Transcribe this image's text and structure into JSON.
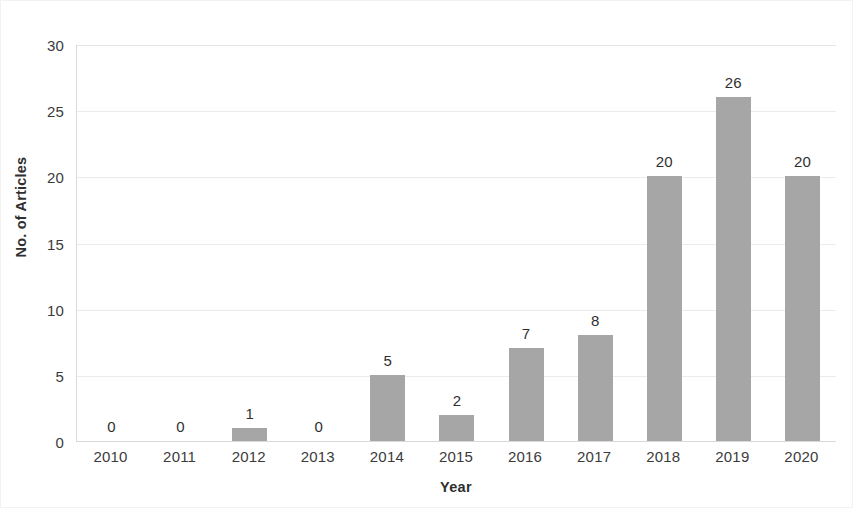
{
  "chart_data": {
    "type": "bar",
    "title": "",
    "xlabel": "Year",
    "ylabel": "No. of Articles",
    "categories": [
      "2010",
      "2011",
      "2012",
      "2013",
      "2014",
      "2015",
      "2016",
      "2017",
      "2018",
      "2019",
      "2020"
    ],
    "values": [
      0,
      0,
      1,
      0,
      5,
      2,
      7,
      8,
      20,
      26,
      20
    ],
    "data_labels": [
      "0",
      "0",
      "1",
      "0",
      "5",
      "2",
      "7",
      "8",
      "20",
      "26",
      "20"
    ],
    "ylim": [
      0,
      30
    ],
    "ytick_values": [
      0,
      5,
      10,
      15,
      20,
      25,
      30
    ],
    "ytick_labels": [
      "0",
      "5",
      "10",
      "15",
      "20",
      "25",
      "30"
    ],
    "grid": "horizontal",
    "legend": "none",
    "bar_color": "#a6a6a6",
    "gridline_color": "#ebebeb",
    "axis_color": "#d9d9d9",
    "text_color": "#3b3b3b",
    "background_color": "#ffffff"
  }
}
